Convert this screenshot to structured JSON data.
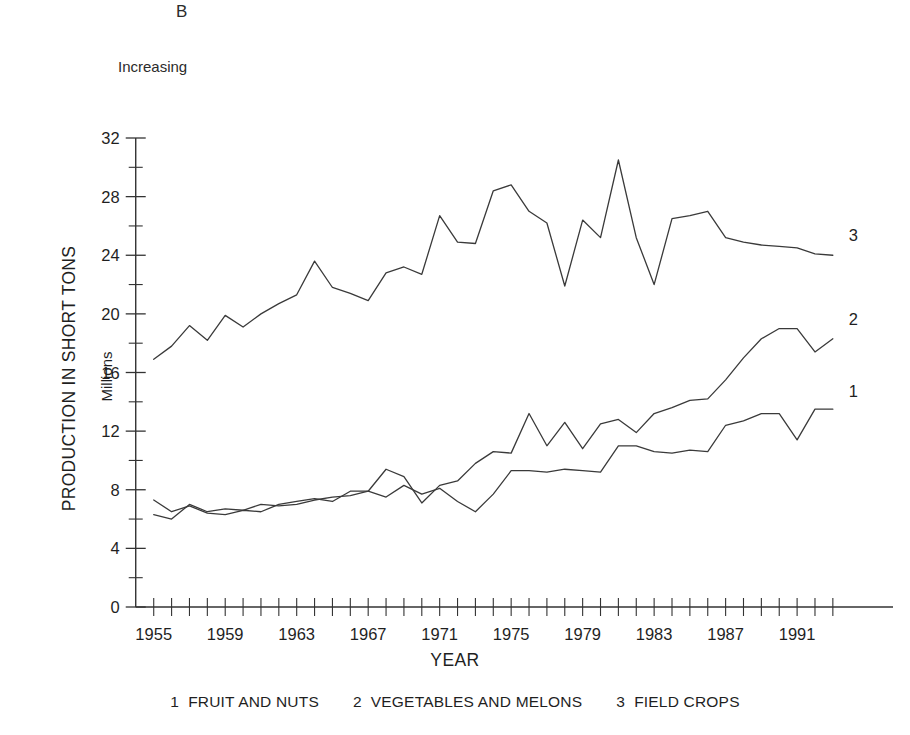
{
  "panel": {
    "letter": "B",
    "subtitle": "Increasing"
  },
  "axes": {
    "xlabel": "YEAR",
    "ylabel_main": "PRODUCTION IN SHORT TONS",
    "ylabel_sub": "Millions"
  },
  "legend": {
    "items": [
      {
        "num": "1",
        "label": "FRUIT AND NUTS"
      },
      {
        "num": "2",
        "label": "VEGETABLES AND MELONS"
      },
      {
        "num": "3",
        "label": "FIELD CROPS"
      }
    ]
  },
  "series_labels": {
    "one": "1",
    "two": "2",
    "three": "3"
  },
  "chart_data": {
    "type": "line",
    "title": "B",
    "subtitle": "Increasing",
    "xlabel": "YEAR",
    "ylabel": "PRODUCTION IN SHORT TONS (Millions)",
    "xlim": [
      1954.4,
      1993.4
    ],
    "ylim": [
      0,
      32
    ],
    "xticks": [
      1955,
      1959,
      1963,
      1967,
      1971,
      1975,
      1979,
      1983,
      1987,
      1991
    ],
    "xtick_labels": [
      "1955",
      "1959",
      "1963",
      "1967",
      "1971",
      "1975",
      "1979",
      "1983",
      "1987",
      "1991"
    ],
    "xtick_minor_step": 1,
    "yticks": [
      0,
      4,
      8,
      12,
      16,
      20,
      24,
      28,
      32
    ],
    "ytick_labels": [
      "0",
      "4",
      "8",
      "12",
      "16",
      "20",
      "24",
      "28",
      "32"
    ],
    "ytick_minor_step": 2,
    "grid": false,
    "legend_position": "below",
    "x": [
      1955,
      1956,
      1957,
      1958,
      1959,
      1960,
      1961,
      1962,
      1963,
      1964,
      1965,
      1966,
      1967,
      1968,
      1969,
      1970,
      1971,
      1972,
      1973,
      1974,
      1975,
      1976,
      1977,
      1978,
      1979,
      1980,
      1981,
      1982,
      1983,
      1984,
      1985,
      1986,
      1987,
      1988,
      1989,
      1990,
      1991,
      1992,
      1993
    ],
    "series": [
      {
        "name": "FRUIT AND NUTS",
        "number": "1",
        "values": [
          7.3,
          6.5,
          6.9,
          6.4,
          6.3,
          6.6,
          6.5,
          7.0,
          7.2,
          7.4,
          7.2,
          7.9,
          7.9,
          7.5,
          8.3,
          7.7,
          8.1,
          7.2,
          6.5,
          7.7,
          9.3,
          9.3,
          9.2,
          9.4,
          9.3,
          9.2,
          11.0,
          11.0,
          10.6,
          10.5,
          10.7,
          10.6,
          12.4,
          12.7,
          13.2,
          13.2,
          11.4,
          13.5,
          13.5
        ]
      },
      {
        "name": "VEGETABLES AND MELONS",
        "number": "2",
        "values": [
          6.3,
          6.0,
          7.0,
          6.5,
          6.7,
          6.6,
          7.0,
          6.9,
          7.0,
          7.3,
          7.5,
          7.6,
          7.9,
          9.4,
          8.9,
          7.1,
          8.3,
          8.6,
          9.8,
          10.6,
          10.5,
          13.2,
          11.0,
          12.6,
          10.8,
          12.5,
          12.8,
          11.9,
          13.2,
          13.6,
          14.1,
          14.2,
          15.5,
          17.0,
          18.3,
          19.0,
          19.0,
          17.4,
          18.3
        ]
      },
      {
        "name": "FIELD CROPS",
        "number": "3",
        "values": [
          16.9,
          17.8,
          19.2,
          18.2,
          19.9,
          19.1,
          20.0,
          20.7,
          21.3,
          23.6,
          21.8,
          21.4,
          20.9,
          22.8,
          23.2,
          22.7,
          26.7,
          24.9,
          24.8,
          28.4,
          28.8,
          27.0,
          26.2,
          21.9,
          26.4,
          25.2,
          30.5,
          25.2,
          22.0,
          26.5,
          26.7,
          27.0,
          25.2,
          24.9,
          24.7,
          24.6,
          24.5,
          24.1,
          24.0
        ]
      }
    ]
  }
}
